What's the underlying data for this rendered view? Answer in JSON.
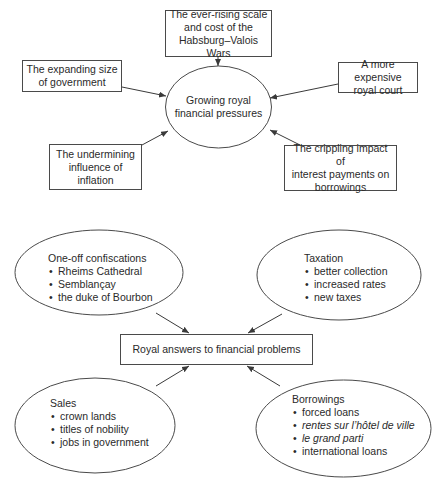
{
  "colors": {
    "line": "#4a4a4a",
    "text": "#2a2a2a",
    "background": "#ffffff"
  },
  "top_diagram": {
    "center": {
      "line1": "Growing royal",
      "line2": "financial pressures"
    },
    "causes": [
      {
        "id": "wars",
        "line1": "The ever-rising scale",
        "line2": "and cost of the",
        "line3": "Habsburg–Valois Wars"
      },
      {
        "id": "government",
        "line1": "The expanding size",
        "line2": "of government"
      },
      {
        "id": "court",
        "line1": "A more expensive",
        "line2": "royal court"
      },
      {
        "id": "inflation",
        "line1": "The undermining",
        "line2": "influence of",
        "line3": "inflation"
      },
      {
        "id": "interest",
        "line1": "The crippling impact of",
        "line2": "interest payments on",
        "line3": "borrowings"
      }
    ]
  },
  "bottom_diagram": {
    "center": {
      "label": "Royal answers to financial problems"
    },
    "answers": [
      {
        "id": "confiscations",
        "title": "One-off confiscations",
        "items": [
          "Rheims Cathedral",
          "Semblançay",
          "the duke of Bourbon"
        ]
      },
      {
        "id": "taxation",
        "title": "Taxation",
        "items": [
          "better collection",
          "increased rates",
          "new taxes"
        ]
      },
      {
        "id": "sales",
        "title": "Sales",
        "items": [
          "crown lands",
          "titles of nobility",
          "jobs in government"
        ]
      },
      {
        "id": "borrowings",
        "title": "Borrowings",
        "items": [
          "forced loans",
          "rentes sur l’hôtel de ville",
          "le grand parti",
          "international loans"
        ],
        "italic_items": [
          1,
          2
        ]
      }
    ]
  }
}
